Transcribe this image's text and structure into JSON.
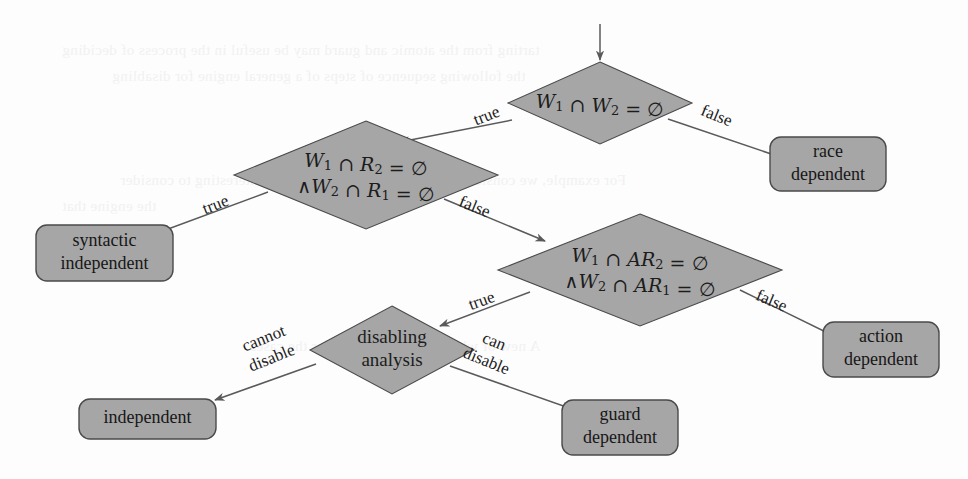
{
  "figure": {
    "type": "decision-flowchart",
    "background_color": "#fdfdfd",
    "node_fill_color": "#a6a6a6",
    "node_stroke_color": "#4a4a4a",
    "edge_color": "#5a5a5a",
    "text_color": "#1c1c1c"
  },
  "entry": {
    "name": "entry-arrow",
    "target": "d1"
  },
  "nodes": [
    {
      "id": "d1",
      "shape": "diamond",
      "name": "decision-w1-w2-disjoint",
      "lines": [
        "W₁ ∩ W₂ = ∅"
      ],
      "line1_a": "W",
      "line1_sub_a": "1",
      "line1_op": "∩",
      "line1_b": "W",
      "line1_sub_b": "2",
      "line1_eq": "= ∅",
      "cx": 600,
      "cy": 103,
      "rx": 92,
      "ry": 41
    },
    {
      "id": "d2",
      "shape": "diamond",
      "name": "decision-w1-r2-and-w2-r1-disjoint",
      "lines": [
        "W₁ ∩ R₂ = ∅",
        "∧W₂ ∩ R₁ = ∅"
      ],
      "cx": 366,
      "cy": 175,
      "rx": 132,
      "ry": 54
    },
    {
      "id": "d3",
      "shape": "diamond",
      "name": "decision-w1-ar2-and-w2-ar1-disjoint",
      "lines": [
        "W₁ ∩ AR₂ = ∅",
        "∧W₂ ∩ AR₁ = ∅"
      ],
      "cx": 640,
      "cy": 270,
      "rx": 142,
      "ry": 56
    },
    {
      "id": "d4",
      "shape": "diamond",
      "name": "decision-disabling-analysis",
      "lines": [
        "disabling",
        "analysis"
      ],
      "cx": 392,
      "cy": 350,
      "rx": 82,
      "ry": 44
    },
    {
      "id": "b1",
      "shape": "box",
      "name": "result-race-dependent",
      "lines": [
        "race",
        "dependent"
      ],
      "x": 770,
      "y": 137,
      "w": 116,
      "h": 54
    },
    {
      "id": "b2",
      "shape": "box",
      "name": "result-syntactic-independent",
      "lines": [
        "syntactic",
        "independent"
      ],
      "x": 36,
      "y": 225,
      "w": 137,
      "h": 56
    },
    {
      "id": "b3",
      "shape": "box",
      "name": "result-action-dependent",
      "lines": [
        "action",
        "dependent"
      ],
      "x": 823,
      "y": 322,
      "w": 116,
      "h": 55
    },
    {
      "id": "b4",
      "shape": "box",
      "name": "result-independent",
      "lines": [
        "independent"
      ],
      "x": 79,
      "y": 399,
      "w": 137,
      "h": 40
    },
    {
      "id": "b5",
      "shape": "box",
      "name": "result-guard-dependent",
      "lines": [
        "guard",
        "dependent"
      ],
      "x": 562,
      "y": 400,
      "w": 116,
      "h": 55
    }
  ],
  "edges": [
    {
      "name": "edge-d1-true-to-d2",
      "from": "d1",
      "to": "d2",
      "label": "true",
      "label_x": 487,
      "label_y": 117,
      "label_rotate": -21,
      "path": "M 512 120 L 400 142"
    },
    {
      "name": "edge-d1-false-to-race-dependent",
      "from": "d1",
      "to": "b1",
      "label": "false",
      "label_x": 716,
      "label_y": 117,
      "label_rotate": 22,
      "path": "M 668 119 L 786 159"
    },
    {
      "name": "edge-d2-true-to-syntactic-independent",
      "from": "d2",
      "to": "b2",
      "label": "true",
      "label_x": 216,
      "label_y": 206,
      "label_rotate": -21,
      "path": "M 268 192 L 160 232"
    },
    {
      "name": "edge-d2-false-to-d3",
      "from": "d2",
      "to": "d3",
      "label": "false",
      "label_x": 474,
      "label_y": 208,
      "label_rotate": 22,
      "path": "M 444 199 L 545 241"
    },
    {
      "name": "edge-d3-true-to-disabling-analysis",
      "from": "d3",
      "to": "d4",
      "label": "true",
      "label_x": 482,
      "label_y": 302,
      "label_rotate": -20,
      "path": "M 530 292 L 440 326"
    },
    {
      "name": "edge-d3-false-to-action-dependent",
      "from": "d3",
      "to": "b3",
      "label": "false",
      "label_x": 771,
      "label_y": 302,
      "label_rotate": 23,
      "path": "M 740 290 L 838 338"
    },
    {
      "name": "edge-d4-cannot-disable-to-independent",
      "from": "d4",
      "to": "b4",
      "label_line1": "cannot",
      "label_line2": "disable",
      "label_x": 268,
      "label_y": 349,
      "label_rotate": -22,
      "path": "M 316 364 L 215 400"
    },
    {
      "name": "edge-d4-can-disable-to-guard-dependent",
      "from": "d4",
      "to": "b5",
      "label_line1": "can",
      "label_line2": "disable",
      "label_x": 490,
      "label_y": 352,
      "label_rotate": 22,
      "path": "M 450 366 L 572 409"
    }
  ],
  "bleed_text": [
    {
      "text": "tarting from the atomic and guard may be useful in the process of deciding",
      "x": 62,
      "y": 42
    },
    {
      "text": "the following sequence of steps of a general engine for disabling",
      "x": 112,
      "y": 68
    },
    {
      "text": "For example, we consider a set of W with the end I. It is interesting to consider",
      "x": 120,
      "y": 172
    },
    {
      "text": "the engine that",
      "x": 62,
      "y": 198
    },
    {
      "text": "2.3. Method",
      "x": 62,
      "y": 252
    },
    {
      "text": "A new of whole clause, it shows for the cases",
      "x": 250,
      "y": 338
    }
  ]
}
